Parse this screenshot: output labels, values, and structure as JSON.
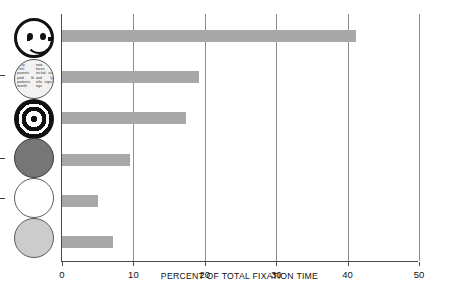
{
  "chart_data": {
    "type": "bar",
    "orientation": "horizontal",
    "title": "",
    "xlabel": "PERCENT OF TOTAL FIXATION TIME",
    "ylabel": "",
    "xlim": [
      0,
      50
    ],
    "xticks": [
      0,
      10,
      20,
      30,
      40,
      50
    ],
    "xtick_labels": [
      "0",
      "10",
      "20",
      "30",
      "40",
      "50"
    ],
    "grid": "vertical",
    "legend": "none",
    "bar_color": "#a8a8a8",
    "categories": [
      "schematic face",
      "newsprint",
      "bullseye",
      "dark gray disk",
      "white disk",
      "light gray disk"
    ],
    "values": [
      41.2,
      19.2,
      17.4,
      9.5,
      5.1,
      7.2
    ]
  },
  "icons": [
    {
      "name": "schematic-face-icon",
      "kind": "face",
      "label": "schematic face",
      "fill": "#ffffff",
      "stroke": "#111111"
    },
    {
      "name": "newsprint-icon",
      "kind": "newsprint",
      "label": "newsprint",
      "fill": "#f2f2f2",
      "stroke": "#555555",
      "text": "rality Ther parents paid th patterns month now faces e includ ust and ly info signs ngs"
    },
    {
      "name": "bullseye-icon",
      "kind": "bullseye",
      "label": "bullseye",
      "fill": "#111111",
      "stroke": "#111111"
    },
    {
      "name": "dark-gray-disk-icon",
      "kind": "disk-dark",
      "label": "dark gray disk",
      "fill": "#767676",
      "stroke": "#3a3a3a"
    },
    {
      "name": "white-disk-icon",
      "kind": "disk-white",
      "label": "white disk",
      "fill": "#ffffff",
      "stroke": "#5a5a5a"
    },
    {
      "name": "light-gray-disk-icon",
      "kind": "disk-light",
      "label": "light gray disk",
      "fill": "#cccccc",
      "stroke": "#5a5a5a"
    }
  ]
}
